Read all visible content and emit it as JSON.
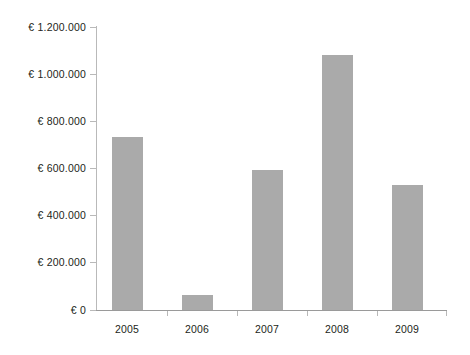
{
  "chart_data": {
    "type": "bar",
    "title": "",
    "subtitle": "",
    "xlabel": "",
    "ylabel": "",
    "categories": [
      "2005",
      "2006",
      "2007",
      "2008",
      "2009"
    ],
    "values": [
      735000,
      65000,
      595000,
      1080000,
      530000
    ],
    "series": [
      {
        "name": "",
        "values": [
          735000,
          65000,
          595000,
          1080000,
          530000
        ]
      }
    ],
    "ylim": [
      0,
      1200000
    ],
    "ytick_values": [
      0,
      200000,
      400000,
      600000,
      800000,
      1000000,
      1200000
    ],
    "ytick_labels": [
      "€ 0",
      "€ 200.000",
      "€ 400.000",
      "€ 600.000",
      "€ 800.000",
      "€ 1.000.000",
      "€ 1.200.000"
    ],
    "grid": false,
    "legend": false,
    "legend_position": "none",
    "bar_color": "#aaaaaa",
    "axis_color": "#b9b9b9",
    "currency_symbol": "€",
    "thousands_separator": "."
  }
}
